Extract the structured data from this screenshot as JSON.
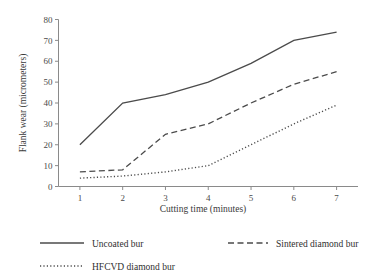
{
  "chart_data": {
    "type": "line",
    "title": "",
    "xlabel": "Cutting time (minutes)",
    "ylabel": "Flank wear (micrometers)",
    "x": [
      1,
      2,
      3,
      4,
      5,
      6,
      7
    ],
    "xtick_labels": [
      "1",
      "2",
      "3",
      "4",
      "5",
      "6",
      "7"
    ],
    "ytick_labels": [
      "0",
      "10",
      "20",
      "30",
      "40",
      "50",
      "60",
      "70",
      "80"
    ],
    "yticks": [
      0,
      10,
      20,
      30,
      40,
      50,
      60,
      70,
      80
    ],
    "xlim": [
      0.5,
      7.5
    ],
    "ylim": [
      0,
      80
    ],
    "grid": false,
    "legend_position": "below-plot",
    "series": [
      {
        "name": "Uncoated bur",
        "style": "solid",
        "color": "#4b4b4b",
        "values": [
          20,
          40,
          44,
          50,
          59,
          70,
          74
        ]
      },
      {
        "name": "Sintered diamond bur",
        "style": "dashed",
        "color": "#4b4b4b",
        "values": [
          7,
          8,
          25,
          30,
          40,
          49,
          55
        ]
      },
      {
        "name": "HFCVD diamond bur",
        "style": "dotted",
        "color": "#4b4b4b",
        "values": [
          4,
          5,
          7,
          10,
          20,
          30,
          39
        ]
      }
    ]
  },
  "legend": {
    "items": [
      {
        "label": "Uncoated bur",
        "style": "solid"
      },
      {
        "label": "Sintered diamond bur",
        "style": "dashed"
      },
      {
        "label": "HFCVD diamond bur",
        "style": "dotted"
      }
    ]
  }
}
